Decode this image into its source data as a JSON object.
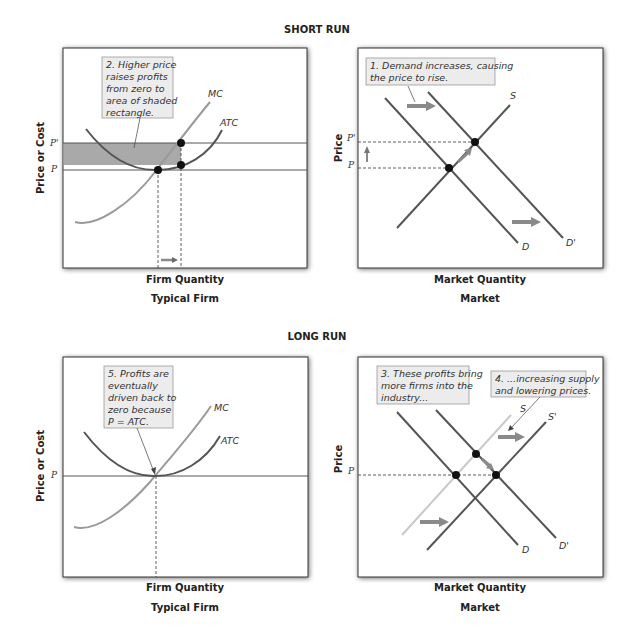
{
  "sections": {
    "short_run": "SHORT RUN",
    "long_run": "LONG RUN"
  },
  "panels": {
    "short_firm": {
      "ylabel": "Price or Cost",
      "xlabel": "Firm Quantity",
      "caption": "Typical Firm",
      "ticks": [
        "P'",
        "P"
      ],
      "curves": [
        "MC",
        "ATC"
      ],
      "note": [
        "2. Higher price",
        "raises profits",
        "from zero to",
        "area of shaded",
        "rectangle."
      ]
    },
    "short_market": {
      "ylabel": "Price",
      "xlabel": "Market Quantity",
      "caption": "Market",
      "ticks": [
        "P'",
        "P"
      ],
      "curves": [
        "S",
        "D",
        "D'"
      ],
      "note": [
        "1. Demand increases, causing",
        "the price to rise."
      ]
    },
    "long_firm": {
      "ylabel": "Price or Cost",
      "xlabel": "Firm Quantity",
      "caption": "Typical Firm",
      "ticks": [
        "P"
      ],
      "curves": [
        "MC",
        "ATC"
      ],
      "note": [
        "5. Profits are",
        "eventually",
        "driven back to",
        "zero because",
        "P = ATC."
      ]
    },
    "long_market": {
      "ylabel": "Price",
      "xlabel": "Market Quantity",
      "caption": "Market",
      "ticks": [
        "P"
      ],
      "curves": [
        "S",
        "S'",
        "D",
        "D'"
      ],
      "note_left": [
        "3. These profits bring",
        "more firms into the",
        "industry..."
      ],
      "note_right": [
        "4. ...increasing supply",
        "and lowering prices."
      ]
    }
  },
  "colors": {
    "curve_dark": "#555555",
    "curve_light": "#9a9a9a",
    "curve_faint": "#c8c8c8",
    "shaded": "#a9a9a9",
    "note_bg": "#ececec",
    "arrow": "#8a8a8a",
    "point": "#111111"
  }
}
